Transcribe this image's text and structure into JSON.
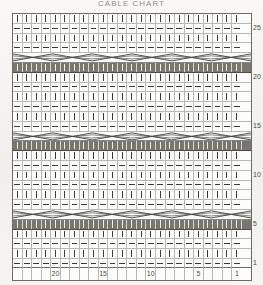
{
  "title": "CABLE CHART",
  "chart_data": {
    "type": "table",
    "title": "CABLE CHART",
    "xlabel": "Stitch",
    "ylabel": "Row",
    "grid": true,
    "columns": 24,
    "rows": 26,
    "col_tick_labels": [
      "",
      "",
      "",
      "",
      "20",
      "",
      "",
      "",
      "",
      "15",
      "",
      "",
      "",
      "",
      "10",
      "",
      "",
      "",
      "",
      "5",
      "",
      "",
      "",
      "1"
    ],
    "row_tick_labels": {
      "25": "25",
      "20": "20",
      "15": "15",
      "10": "10",
      "5": "5",
      "1": "1"
    },
    "legend": [
      {
        "symbol": "|",
        "name": "knit-stitch",
        "meaning": "knit on right side"
      },
      {
        "symbol": "—",
        "name": "purl-stitch",
        "meaning": "purl on right side"
      },
      {
        "symbol": "✕",
        "name": "cable-cross",
        "meaning": "cable cross row"
      },
      {
        "symbol": "█",
        "name": "shaded-band",
        "meaning": "cable hold band"
      }
    ],
    "row_types": [
      "knit",
      "purl",
      "knit",
      "purl",
      "cable",
      "band",
      "knit",
      "purl",
      "knit",
      "purl",
      "knit",
      "purl",
      "cable",
      "band",
      "knit",
      "purl",
      "knit",
      "purl",
      "knit",
      "purl",
      "cable",
      "band",
      "knit",
      "purl",
      "knit",
      "purl"
    ],
    "row_numbers": [
      26,
      25,
      24,
      23,
      22,
      21,
      20,
      19,
      18,
      17,
      16,
      15,
      14,
      13,
      12,
      11,
      10,
      9,
      8,
      7,
      6,
      5,
      4,
      3,
      2,
      1
    ]
  }
}
